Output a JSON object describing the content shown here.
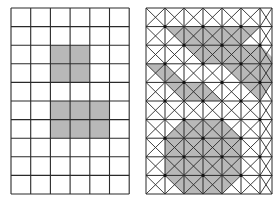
{
  "figure": {
    "colors": {
      "background": "#ffffff",
      "line": "#2a2a2a",
      "shade": "#b8b8b8",
      "node": "#111111"
    }
  },
  "left_grid": {
    "x": 11,
    "y": 8,
    "cols": 6,
    "rows": 10,
    "cell_w": 19.7,
    "cell_h": 18.6,
    "shaded_cells": [
      {
        "col": 2,
        "row": 2
      },
      {
        "col": 3,
        "row": 2
      },
      {
        "col": 2,
        "row": 3
      },
      {
        "col": 3,
        "row": 3
      },
      {
        "col": 2,
        "row": 5
      },
      {
        "col": 3,
        "row": 5
      },
      {
        "col": 4,
        "row": 5
      },
      {
        "col": 2,
        "row": 6
      },
      {
        "col": 3,
        "row": 6
      },
      {
        "col": 4,
        "row": 6
      }
    ]
  },
  "right_grid": {
    "x": 146,
    "y": 8,
    "cols": 7,
    "rows": 10,
    "cell_w": 19,
    "cell_h": 18.6,
    "right_edge": 272,
    "shaded_polygons": [
      [
        [
          165,
          27
        ],
        [
          260,
          27
        ],
        [
          222,
          64
        ],
        [
          203,
          64
        ],
        [
          184,
          45
        ]
      ],
      [
        [
          146,
          64
        ],
        [
          165,
          64
        ],
        [
          184,
          82
        ],
        [
          203,
          82
        ],
        [
          222,
          101
        ],
        [
          184,
          101
        ],
        [
          165,
          82
        ]
      ],
      [
        [
          241,
          45
        ],
        [
          260,
          45
        ],
        [
          272,
          57
        ],
        [
          272,
          82
        ],
        [
          260,
          101
        ],
        [
          241,
          82
        ],
        [
          222,
          64
        ]
      ],
      [
        [
          184,
          120
        ],
        [
          222,
          120
        ],
        [
          241,
          138
        ],
        [
          241,
          175
        ],
        [
          222,
          194
        ],
        [
          184,
          194
        ],
        [
          165,
          175
        ],
        [
          165,
          138
        ]
      ]
    ]
  }
}
